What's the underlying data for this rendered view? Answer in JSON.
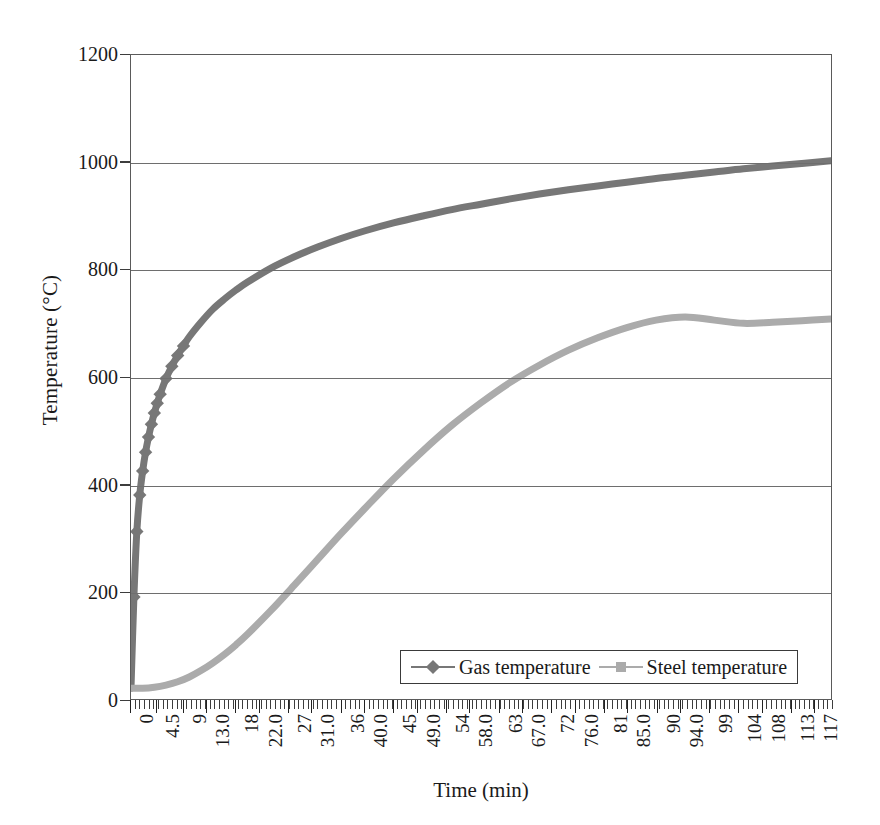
{
  "chart_data": {
    "type": "line",
    "title": "",
    "xlabel": "Time (min)",
    "ylabel": "Temperature (°C)",
    "xlim": [
      0,
      120
    ],
    "ylim": [
      0,
      1200
    ],
    "grid": true,
    "legend_position": "inside-bottom-right",
    "y_ticks": [
      0,
      200,
      400,
      600,
      800,
      1000,
      1200
    ],
    "y_tick_labels": [
      "0",
      "200",
      "400",
      "600",
      "800",
      "1000",
      "1200"
    ],
    "x_tick_labels": [
      "0",
      "4.5",
      "9",
      "13.0",
      "18",
      "22.0",
      "27",
      "31.0",
      "36",
      "40.0",
      "45",
      "49.0",
      "54",
      "58.0",
      "63",
      "67.0",
      "72",
      "76.0",
      "81",
      "85.0",
      "90",
      "94.0",
      "99",
      "104",
      "108",
      "113",
      "117"
    ],
    "x_tick_values": [
      0,
      4.5,
      9,
      13.0,
      18,
      22.0,
      27,
      31.0,
      36,
      40.0,
      45,
      49.0,
      54,
      58.0,
      63,
      67.0,
      72,
      76.0,
      81,
      85.0,
      90,
      94.0,
      99,
      104,
      108,
      113,
      117
    ],
    "series": [
      {
        "name": "Gas temperature",
        "color": "#777777",
        "marker": "diamond",
        "x": [
          0,
          0.5,
          1,
          1.5,
          2,
          2.5,
          3,
          3.5,
          4,
          4.5,
          5,
          6,
          7,
          8,
          9,
          10,
          12,
          14,
          16,
          18,
          20,
          24,
          28,
          32,
          36,
          40,
          45,
          50,
          55,
          60,
          65,
          70,
          75,
          80,
          85,
          90,
          95,
          100,
          105,
          110,
          115,
          120
        ],
        "y": [
          20,
          190,
          312,
          380,
          425,
          460,
          488,
          512,
          533,
          551,
          568,
          597,
          620,
          640,
          658,
          675,
          702,
          726,
          745,
          762,
          777,
          803,
          824,
          842,
          858,
          872,
          887,
          900,
          912,
          922,
          932,
          941,
          949,
          956,
          963,
          970,
          976,
          982,
          988,
          993,
          998,
          1003
        ]
      },
      {
        "name": "Steel temperature",
        "color": "#ababab",
        "marker": "square",
        "x": [
          0,
          2,
          4,
          6,
          8,
          10,
          12,
          14,
          16,
          18,
          20,
          24,
          28,
          32,
          36,
          40,
          45,
          50,
          55,
          60,
          65,
          70,
          75,
          80,
          85,
          90,
          95,
          100,
          105,
          110,
          115,
          120
        ],
        "y": [
          20,
          20,
          22,
          26,
          32,
          41,
          53,
          67,
          83,
          101,
          121,
          165,
          212,
          260,
          308,
          354,
          410,
          462,
          510,
          552,
          590,
          622,
          650,
          673,
          692,
          706,
          712,
          706,
          700,
          702,
          705,
          708
        ]
      }
    ]
  },
  "legend": {
    "entries": [
      {
        "label": "Gas temperature",
        "color": "#777777",
        "marker": "diamond"
      },
      {
        "label": "Steel temperature",
        "color": "#ababab",
        "marker": "square"
      }
    ]
  },
  "axes": {
    "y_title": "Temperature (°C)",
    "x_title": "Time (min)"
  }
}
